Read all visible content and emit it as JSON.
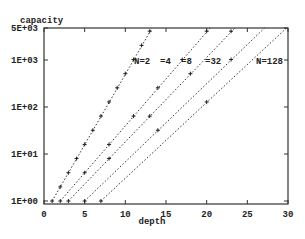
{
  "chart_data": {
    "type": "line",
    "title": "",
    "xlabel": "depth",
    "ylabel": "capacity",
    "xlim": [
      0,
      30
    ],
    "ylim": [
      1,
      5000
    ],
    "yscale": "log",
    "grid": false,
    "legend": "inline labels near top of each line",
    "x_ticks": [
      "0",
      "5",
      "10",
      "15",
      "20",
      "25",
      "30"
    ],
    "y_ticks": [
      "1E+00",
      "1E+01",
      "1E+02",
      "1E+03",
      "5E+03"
    ],
    "series": [
      {
        "name": "N=2",
        "label": "N=2",
        "points": [
          [
            1,
            1
          ],
          [
            2,
            2
          ],
          [
            3,
            4
          ],
          [
            4,
            8
          ],
          [
            5,
            16
          ],
          [
            6,
            32
          ],
          [
            7,
            64
          ],
          [
            8,
            128
          ],
          [
            9,
            256
          ],
          [
            10,
            512
          ],
          [
            11,
            1024
          ],
          [
            12,
            2048
          ],
          [
            13,
            4096
          ]
        ]
      },
      {
        "name": "N=4",
        "label": "=4",
        "points": [
          [
            2,
            1
          ],
          [
            5,
            4
          ],
          [
            8,
            16
          ],
          [
            11,
            64
          ],
          [
            14,
            256
          ],
          [
            17,
            1024
          ],
          [
            20,
            4096
          ]
        ]
      },
      {
        "name": "N=8",
        "label": "=8",
        "points": [
          [
            3,
            1
          ],
          [
            8,
            8
          ],
          [
            13,
            64
          ],
          [
            18,
            512
          ],
          [
            23,
            4096
          ]
        ]
      },
      {
        "name": "N=32",
        "label": "=32",
        "points": [
          [
            5,
            1
          ],
          [
            14,
            32
          ],
          [
            23,
            1024
          ]
        ]
      },
      {
        "name": "N=128",
        "label": "N=128",
        "points": [
          [
            7,
            1
          ],
          [
            20,
            128
          ]
        ]
      }
    ]
  }
}
